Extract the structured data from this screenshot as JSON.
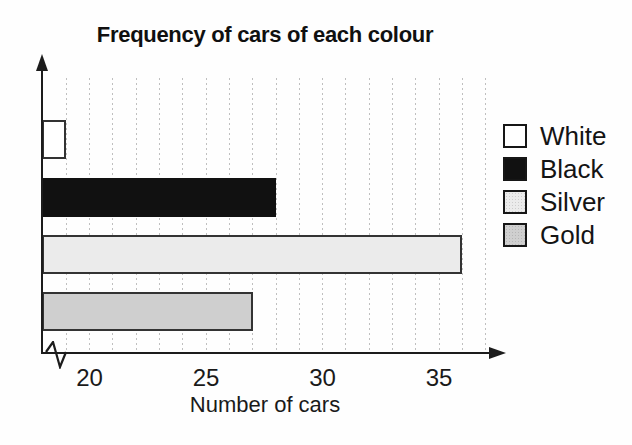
{
  "chart_data": {
    "type": "bar",
    "orientation": "horizontal",
    "title": "Frequency of cars of each colour",
    "xlabel": "Number of cars",
    "categories": [
      "White",
      "Black",
      "Silver",
      "Gold"
    ],
    "values": [
      19,
      28,
      36,
      27
    ],
    "xticks": [
      20,
      25,
      30,
      35
    ],
    "xlim": [
      18,
      37.5
    ],
    "gridline_step": 1,
    "grid_on": true,
    "axis_break": true,
    "legend_position": "right",
    "legend_entries": [
      "White",
      "Black",
      "Silver",
      "Gold"
    ],
    "bar_colors": {
      "White": "#ffffff",
      "Black": "#111111",
      "Silver": "#ebebeb",
      "Gold": "#cfcfcf"
    },
    "textured_categories": [
      "Silver",
      "Gold"
    ],
    "axis_color": "#1c1c1c",
    "bar_border_color": "#333333",
    "gridline_color": "#bfbfbf"
  }
}
